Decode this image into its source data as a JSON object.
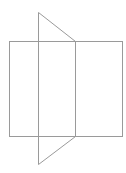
{
  "diagram": {
    "canvas": {
      "width": 126,
      "height": 173,
      "background": "#ffffff"
    },
    "stroke_color": "#9a9a9a",
    "stroke_width": 1,
    "shapes": {
      "rectangle": {
        "x": 9,
        "y": 41,
        "width": 113,
        "height": 95
      },
      "divider_line": {
        "x1": 75,
        "y1": 41,
        "x2": 75,
        "y2": 136
      },
      "fold_quad": {
        "points": "38,12 75,41 75,136 38,164"
      }
    }
  }
}
